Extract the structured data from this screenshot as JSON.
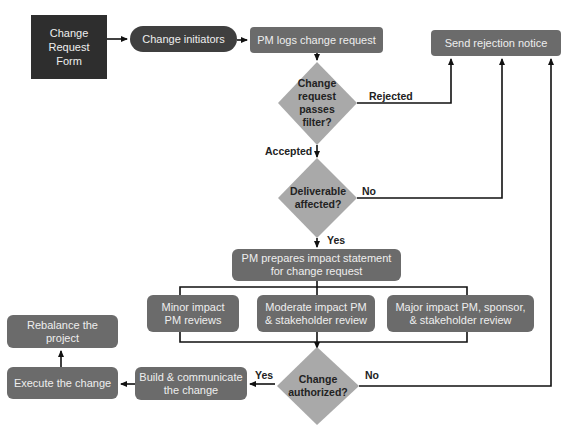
{
  "diagram": {
    "type": "flowchart",
    "nodes": {
      "change_request_form": "Change Request Form",
      "change_request_form_lines": [
        "Change",
        "Request",
        "Form"
      ],
      "change_initiators": "Change initiators",
      "pm_logs": "PM logs change request",
      "send_rejection": "Send rejection notice",
      "passes_filter_lines": [
        "Change",
        "request",
        "passes",
        "filter?"
      ],
      "deliverable_affected_lines": [
        "Deliverable",
        "affected?"
      ],
      "pm_prepares_lines": [
        "PM prepares impact statement",
        "for change request"
      ],
      "minor_impact_lines": [
        "Minor impact",
        "PM reviews"
      ],
      "moderate_impact_lines": [
        "Moderate impact PM",
        "& stakeholder review"
      ],
      "major_impact_lines": [
        "Major impact PM, sponsor,",
        "& stakeholder review"
      ],
      "change_authorized_lines": [
        "Change",
        "authorized?"
      ],
      "build_communicate_lines": [
        "Build & communicate",
        "the change"
      ],
      "execute_change": "Execute the change",
      "rebalance_project": "Rebalance the project"
    },
    "edge_labels": {
      "rejected": "Rejected",
      "accepted": "Accepted",
      "no_deliverable": "No",
      "yes_deliverable": "Yes",
      "yes_authorized": "Yes",
      "no_authorized": "No"
    },
    "edges": [
      {
        "from": "Change Request Form",
        "to": "Change initiators"
      },
      {
        "from": "Change initiators",
        "to": "PM logs change request"
      },
      {
        "from": "PM logs change request",
        "to": "Change request passes filter?"
      },
      {
        "from": "Change request passes filter?",
        "to": "Send rejection notice",
        "label": "Rejected"
      },
      {
        "from": "Change request passes filter?",
        "to": "Deliverable affected?",
        "label": "Accepted"
      },
      {
        "from": "Deliverable affected?",
        "to": "Send rejection notice",
        "label": "No"
      },
      {
        "from": "Deliverable affected?",
        "to": "PM prepares impact statement for change request",
        "label": "Yes"
      },
      {
        "from": "PM prepares impact statement for change request",
        "to": "Minor impact PM reviews"
      },
      {
        "from": "PM prepares impact statement for change request",
        "to": "Moderate impact PM & stakeholder review"
      },
      {
        "from": "PM prepares impact statement for change request",
        "to": "Major impact PM, sponsor, & stakeholder review"
      },
      {
        "from": "Impact reviews",
        "to": "Change authorized?"
      },
      {
        "from": "Change authorized?",
        "to": "Build & communicate the change",
        "label": "Yes"
      },
      {
        "from": "Change authorized?",
        "to": "Send rejection notice",
        "label": "No"
      },
      {
        "from": "Build & communicate the change",
        "to": "Execute the change"
      },
      {
        "from": "Execute the change",
        "to": "Rebalance the project"
      }
    ],
    "colors": {
      "form_box": "#2e2e2e",
      "pill": "#3f3f3f",
      "process_box": "#6b6b6b",
      "diamond": "#a9a9a9",
      "line": "#111111",
      "box_text": "#eeeeee",
      "label_text": "#222222"
    }
  }
}
